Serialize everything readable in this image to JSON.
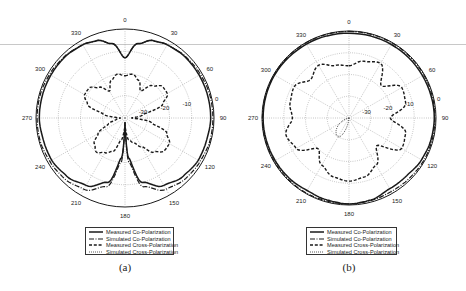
{
  "figure": {
    "panels": [
      {
        "id": "a",
        "caption": "(a)",
        "center": [
          125,
          118
        ],
        "radius": 89,
        "legend": {
          "x": 85,
          "y": 227,
          "w": 89,
          "h": 28
        }
      },
      {
        "id": "b",
        "caption": "(b)",
        "center": [
          349,
          118
        ],
        "radius": 87,
        "legend": {
          "x": 306,
          "y": 227,
          "w": 91,
          "h": 28
        }
      }
    ],
    "legend_entries": [
      {
        "label": "Measured Co-Polarization",
        "style": "solid"
      },
      {
        "label": "Simulated Co-Polarization",
        "style": "dashdot"
      },
      {
        "label": "Measured Cross-Polarization",
        "style": "dashed"
      },
      {
        "label": "Simulated Cross-Polarization",
        "style": "dotted"
      }
    ],
    "colors": {
      "line": "#1a1a1a",
      "grid": "#8a8a8a",
      "text": "#222222",
      "background": "#ffffff"
    }
  },
  "chart_data": [
    {
      "type": "polar",
      "panel": "(a)",
      "title": "",
      "angular_ticks": [
        "0",
        "30",
        "60",
        "90",
        "120",
        "150",
        "180",
        "210",
        "240",
        "270",
        "300",
        "330"
      ],
      "angular_tick_degrees": [
        0,
        30,
        60,
        90,
        120,
        150,
        180,
        210,
        240,
        270,
        300,
        330
      ],
      "radial_ticks": [
        "-30",
        "-20",
        "-10",
        "0"
      ],
      "radial_range_db": [
        -40,
        0
      ],
      "grid": true,
      "legend_position": "below",
      "series": [
        {
          "name": "Measured Co-Polarization",
          "style": "solid",
          "theta_deg": [
            0,
            10,
            20,
            30,
            45,
            60,
            75,
            90,
            105,
            120,
            135,
            150,
            165,
            175,
            180,
            185,
            195,
            210,
            225,
            240,
            255,
            270,
            285,
            300,
            315,
            330,
            340,
            350,
            360
          ],
          "r_db": [
            -13,
            -6,
            -3,
            -2,
            -1.5,
            -1.5,
            -1.5,
            -1.5,
            -2,
            -2,
            -3,
            -5,
            -10,
            -22,
            -38,
            -22,
            -10,
            -5,
            -3,
            -2,
            -2,
            -1.5,
            -1.5,
            -1.5,
            -1.5,
            -2,
            -3,
            -6,
            -13
          ]
        },
        {
          "name": "Simulated Co-Polarization",
          "style": "dashdot",
          "theta_deg": [
            0,
            10,
            20,
            30,
            45,
            60,
            75,
            90,
            105,
            120,
            135,
            150,
            165,
            175,
            180,
            185,
            195,
            210,
            225,
            240,
            255,
            270,
            285,
            300,
            315,
            330,
            340,
            350,
            360
          ],
          "r_db": [
            -13,
            -6,
            -3,
            -2,
            -1.2,
            -0.8,
            -0.5,
            -0.5,
            -0.5,
            -1,
            -1.5,
            -3,
            -8,
            -20,
            -38,
            -20,
            -8,
            -3,
            -1.5,
            -1,
            -0.5,
            -0.5,
            -0.5,
            -0.8,
            -1.2,
            -2,
            -3,
            -6,
            -13
          ]
        },
        {
          "name": "Measured Cross-Polarization",
          "style": "dashed",
          "theta_deg": [
            0,
            10,
            20,
            30,
            40,
            50,
            60,
            70,
            80,
            90,
            100,
            110,
            120,
            130,
            140,
            150,
            160,
            170,
            180,
            190,
            200,
            210,
            220,
            230,
            240,
            250,
            260,
            270,
            280,
            290,
            300,
            310,
            320,
            330,
            340,
            350,
            360
          ],
          "r_db": [
            -21,
            -20,
            -22,
            -26,
            -21,
            -18,
            -18,
            -22,
            -32,
            -37,
            -28,
            -20,
            -17,
            -17,
            -20,
            -25,
            -28,
            -30,
            -36,
            -30,
            -24,
            -22,
            -20,
            -22,
            -26,
            -32,
            -36,
            -38,
            -30,
            -22,
            -19,
            -19,
            -22,
            -26,
            -22,
            -20,
            -21
          ]
        },
        {
          "name": "Simulated Cross-Polarization",
          "style": "dotted",
          "theta_deg": [
            0,
            90,
            180,
            270,
            360
          ],
          "r_db": [
            -40,
            -40,
            -40,
            -40,
            -40
          ]
        }
      ]
    },
    {
      "type": "polar",
      "panel": "(b)",
      "title": "",
      "angular_ticks": [
        "0",
        "30",
        "60",
        "90",
        "120",
        "150",
        "180",
        "210",
        "240",
        "270",
        "300",
        "330"
      ],
      "angular_tick_degrees": [
        0,
        30,
        60,
        90,
        120,
        150,
        180,
        210,
        240,
        270,
        300,
        330
      ],
      "radial_ticks": [
        "-30",
        "-20",
        "-10",
        "0"
      ],
      "radial_range_db": [
        -40,
        0
      ],
      "grid": true,
      "legend_position": "below",
      "series": [
        {
          "name": "Measured Co-Polarization",
          "style": "solid",
          "theta_deg": [
            0,
            30,
            60,
            90,
            105,
            120,
            135,
            150,
            165,
            180,
            195,
            210,
            225,
            240,
            270,
            300,
            330,
            360
          ],
          "r_db": [
            -1,
            -1,
            -1,
            -0.8,
            -1,
            -1.5,
            -2.5,
            -2.5,
            -1,
            -0.5,
            -1,
            -1.5,
            -1,
            -0.8,
            -0.5,
            -0.5,
            -0.8,
            -1
          ]
        },
        {
          "name": "Simulated Co-Polarization",
          "style": "dashdot",
          "theta_deg": [
            0,
            30,
            60,
            90,
            105,
            120,
            135,
            150,
            165,
            180,
            195,
            210,
            225,
            240,
            270,
            300,
            330,
            360
          ],
          "r_db": [
            -0.2,
            -0.2,
            -0.3,
            -0.5,
            -0.5,
            -0.5,
            -0.8,
            -1,
            -0.8,
            -0.5,
            -0.5,
            -0.3,
            -0.3,
            -0.3,
            -0.2,
            -0.2,
            -0.2,
            -0.2
          ]
        },
        {
          "name": "Measured Cross-Polarization",
          "style": "dashed",
          "theta_deg": [
            0,
            15,
            30,
            45,
            60,
            75,
            90,
            105,
            120,
            135,
            150,
            165,
            180,
            195,
            210,
            225,
            240,
            255,
            270,
            285,
            300,
            315,
            330,
            345,
            360
          ],
          "r_db": [
            -16,
            -13,
            -11,
            -19,
            -12,
            -13,
            -21,
            -13,
            -12,
            -22,
            -15,
            -12,
            -11,
            -12,
            -15,
            -20,
            -12,
            -10,
            -14,
            -12,
            -11,
            -15,
            -12,
            -15,
            -16
          ]
        },
        {
          "name": "Simulated Cross-Polarization",
          "style": "dotted",
          "theta_deg": [
            0,
            90,
            180,
            210,
            270,
            360
          ],
          "r_db": [
            -40,
            -40,
            -40,
            -30,
            -40,
            -40
          ]
        }
      ]
    }
  ]
}
